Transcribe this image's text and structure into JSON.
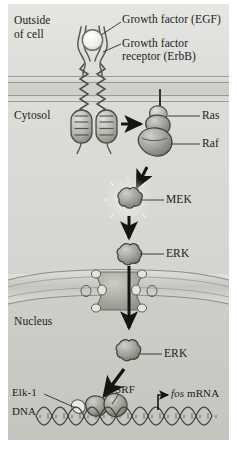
{
  "figure": {
    "type": "biological-signaling-pathway-diagram",
    "background_color": "#dededa",
    "ink_color": "#1b1b1b"
  },
  "compartments": [
    {
      "id": "outside",
      "label_line1": "Outside",
      "label_line2": "of cell",
      "fill": "#e2e2de"
    },
    {
      "id": "membrane",
      "label": "",
      "fill": "#cfcfca"
    },
    {
      "id": "cytosol",
      "label": "Cytosol",
      "fill": "#d8d8d4"
    },
    {
      "id": "nucleus",
      "label": "Nucleus",
      "fill": "#c9c9c4"
    }
  ],
  "labels": {
    "outside_l1": "Outside",
    "outside_l2": "of cell",
    "growth_factor": "Growth factor (EGF)",
    "receptor_l1": "Growth factor",
    "receptor_l2": "receptor (ErbB)",
    "cytosol": "Cytosol",
    "ras": "Ras",
    "raf": "Raf",
    "mek": "MEK",
    "erk_cytosol": "ERK",
    "nucleus": "Nucleus",
    "erk_nucleus": "ERK",
    "elk1": "Elk-1",
    "srf": "SRF",
    "dna": "DNA",
    "fos_italic": "fos",
    "fos_rest": " mRNA"
  },
  "pathway": {
    "steps": [
      {
        "order": 1,
        "molecule": "Growth factor (EGF)",
        "compartment": "outside"
      },
      {
        "order": 2,
        "molecule": "Growth factor receptor (ErbB)",
        "compartment": "membrane"
      },
      {
        "order": 3,
        "molecule": "Ras",
        "compartment": "cytosol"
      },
      {
        "order": 4,
        "molecule": "Raf",
        "compartment": "cytosol"
      },
      {
        "order": 5,
        "molecule": "MEK",
        "compartment": "cytosol"
      },
      {
        "order": 6,
        "molecule": "ERK",
        "compartment": "cytosol"
      },
      {
        "order": 7,
        "molecule": "ERK",
        "compartment": "nucleus"
      },
      {
        "order": 8,
        "molecule": "Elk-1 / SRF",
        "compartment": "nucleus"
      },
      {
        "order": 9,
        "molecule": "fos mRNA",
        "compartment": "nucleus"
      }
    ],
    "arrows": [
      {
        "from": "receptor",
        "to": "Ras",
        "style": "horizontal-solid"
      },
      {
        "from": "Raf",
        "to": "MEK",
        "style": "vertical-solid"
      },
      {
        "from": "MEK",
        "to": "ERK",
        "style": "vertical-solid"
      },
      {
        "from": "ERK",
        "to": "nucleus",
        "style": "vertical-solid-through-pore"
      },
      {
        "from": "ERK",
        "to": "Elk-1",
        "style": "diagonal-solid"
      },
      {
        "from": "DNA",
        "to": "fos mRNA",
        "style": "elbow-solid"
      }
    ]
  }
}
